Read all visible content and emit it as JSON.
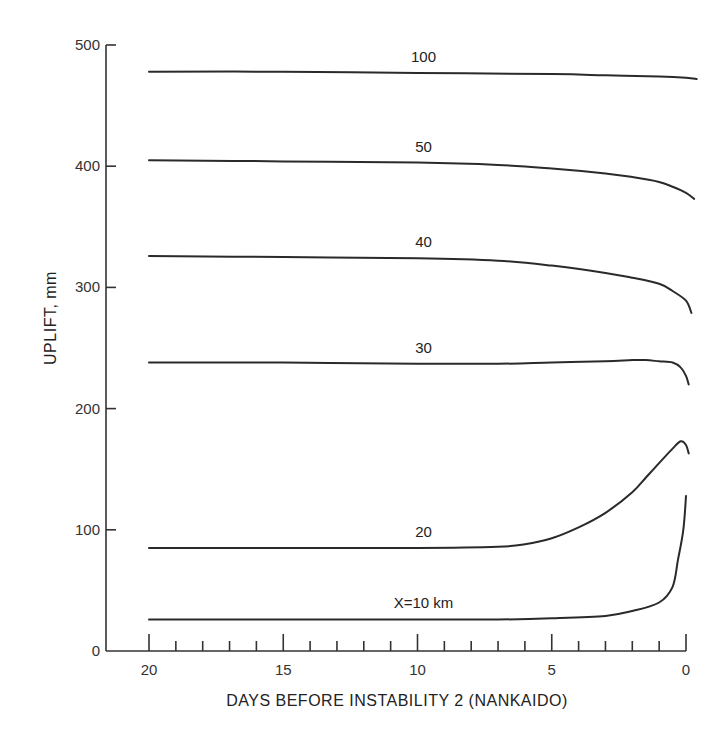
{
  "chart_data": {
    "type": "line",
    "title": "",
    "xlabel": "DAYS BEFORE INSTABILITY 2 (NANKAIDO)",
    "ylabel": "UPLIFT, mm",
    "xlim": [
      21.5,
      -0.4
    ],
    "ylim": [
      0,
      500
    ],
    "x_reversed": true,
    "x_ticks": [
      20,
      15,
      10,
      5,
      0
    ],
    "x_minor_step": 1,
    "y_ticks": [
      0,
      100,
      200,
      300,
      400,
      500
    ],
    "grid": false,
    "legend": "none (curves labeled inline)",
    "series": [
      {
        "name": "100",
        "label": "100",
        "x": [
          20,
          15,
          10,
          5,
          3,
          1,
          0,
          -0.4
        ],
        "y": [
          478,
          478,
          477,
          476,
          475,
          474,
          473,
          472
        ]
      },
      {
        "name": "50",
        "label": "50",
        "x": [
          20,
          15,
          10,
          7,
          5,
          3,
          2,
          1,
          0.5,
          0,
          -0.3
        ],
        "y": [
          405,
          404,
          403,
          401,
          398,
          394,
          391,
          387,
          383,
          378,
          373
        ]
      },
      {
        "name": "40",
        "label": "40",
        "x": [
          20,
          15,
          10,
          7,
          5,
          3,
          2,
          1,
          0.5,
          0,
          -0.2
        ],
        "y": [
          326,
          325,
          324,
          322,
          318,
          312,
          308,
          303,
          297,
          289,
          279
        ]
      },
      {
        "name": "30",
        "label": "30",
        "x": [
          20,
          15,
          10,
          7,
          5,
          3,
          2,
          1.5,
          1,
          0.5,
          0.2,
          0,
          -0.1
        ],
        "y": [
          238,
          238,
          237,
          237,
          238,
          239,
          240,
          240,
          239,
          238,
          234,
          227,
          220
        ]
      },
      {
        "name": "20",
        "label": "20",
        "x": [
          20,
          15,
          10,
          7,
          6,
          5,
          4,
          3,
          2,
          1.5,
          1,
          0.5,
          0.2,
          0,
          -0.1
        ],
        "y": [
          85,
          85,
          85,
          86,
          88,
          93,
          102,
          114,
          131,
          143,
          155,
          167,
          173,
          170,
          163
        ]
      },
      {
        "name": "X=10 km",
        "label": "X=10 km",
        "x": [
          20,
          15,
          10,
          7,
          5,
          3,
          2,
          1,
          0.5,
          0.3,
          0.1,
          0
        ],
        "y": [
          26,
          26,
          26,
          26,
          27,
          29,
          33,
          40,
          53,
          75,
          100,
          128
        ]
      }
    ],
    "label_positions_days": {
      "100": 10,
      "50": 10,
      "40": 10,
      "30": 10,
      "20": 10,
      "X=10 km": 10
    }
  },
  "labels": {
    "xlabel": "DAYS BEFORE INSTABILITY 2 (NANKAIDO)",
    "ylabel": "UPLIFT, mm"
  }
}
